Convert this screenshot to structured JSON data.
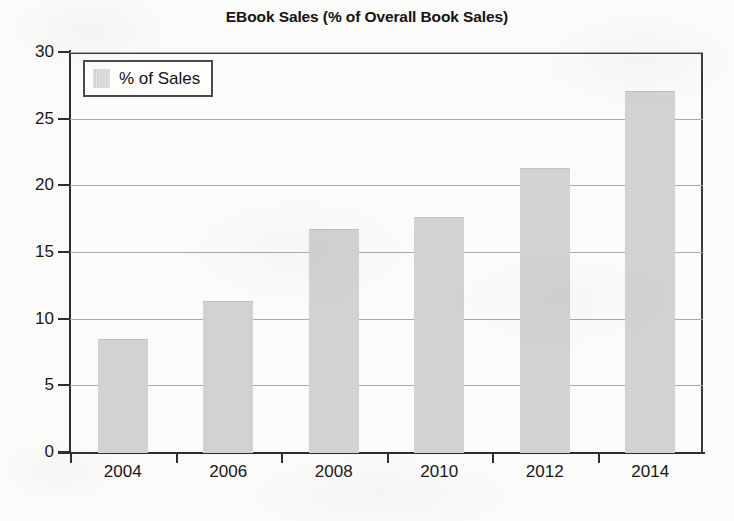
{
  "chart_data": {
    "type": "bar",
    "title": "EBook Sales (% of Overall Book Sales)",
    "xlabel": "",
    "ylabel": "",
    "categories": [
      "2004",
      "2006",
      "2008",
      "2010",
      "2012",
      "2014"
    ],
    "series": [
      {
        "name": "% of Sales",
        "values": [
          8.5,
          11.3,
          16.7,
          17.6,
          21.3,
          27.1
        ]
      }
    ],
    "ylim": [
      0,
      30
    ],
    "y_ticks": [
      0,
      5,
      10,
      15,
      20,
      25,
      30
    ],
    "y_tick_labels": [
      "0",
      "5",
      "10",
      "15",
      "20",
      "25",
      "30"
    ],
    "grid": true,
    "grid_axis": "y",
    "legend": {
      "position": "upper-left",
      "entries": [
        "% of Sales"
      ]
    },
    "colors": {
      "bar_fill": "#d2d2d2",
      "axis": "#2e2e2c",
      "gridline": "#a9a9a7",
      "text": "#191714",
      "background": "#fbfbfa"
    }
  }
}
